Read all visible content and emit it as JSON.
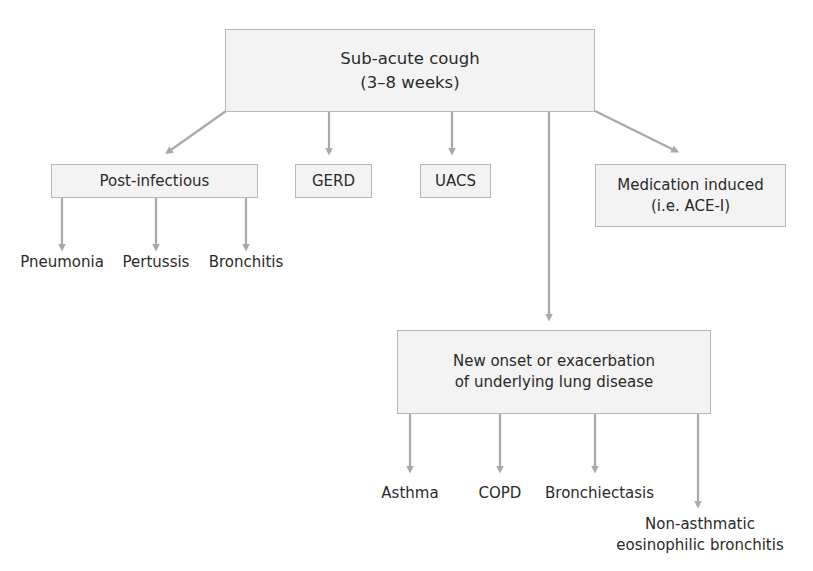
{
  "diagram": {
    "root": {
      "line1": "Sub-acute cough",
      "line2": "(3–8 weeks)"
    },
    "causes": [
      {
        "label": "Post-infectious"
      },
      {
        "label": "GERD"
      },
      {
        "label": "UACS"
      },
      {
        "line1": "Medication induced",
        "line2": "(i.e. ACE-I)"
      },
      {
        "line1": "New onset or exacerbation",
        "line2": "of underlying lung disease"
      }
    ],
    "post_infectious_children": [
      "Pneumonia",
      "Pertussis",
      "Bronchitis"
    ],
    "lung_disease_children": [
      {
        "label": "Asthma"
      },
      {
        "label": "COPD"
      },
      {
        "label": "Bronchiectasis"
      },
      {
        "line1": "Non-asthmatic",
        "line2": "eosinophilic bronchitis"
      }
    ],
    "colors": {
      "box_fill": "#f3f3f3",
      "box_border": "#b8b8b8",
      "arrow": "#a9a9a9",
      "text": "#2a2a2a"
    }
  }
}
